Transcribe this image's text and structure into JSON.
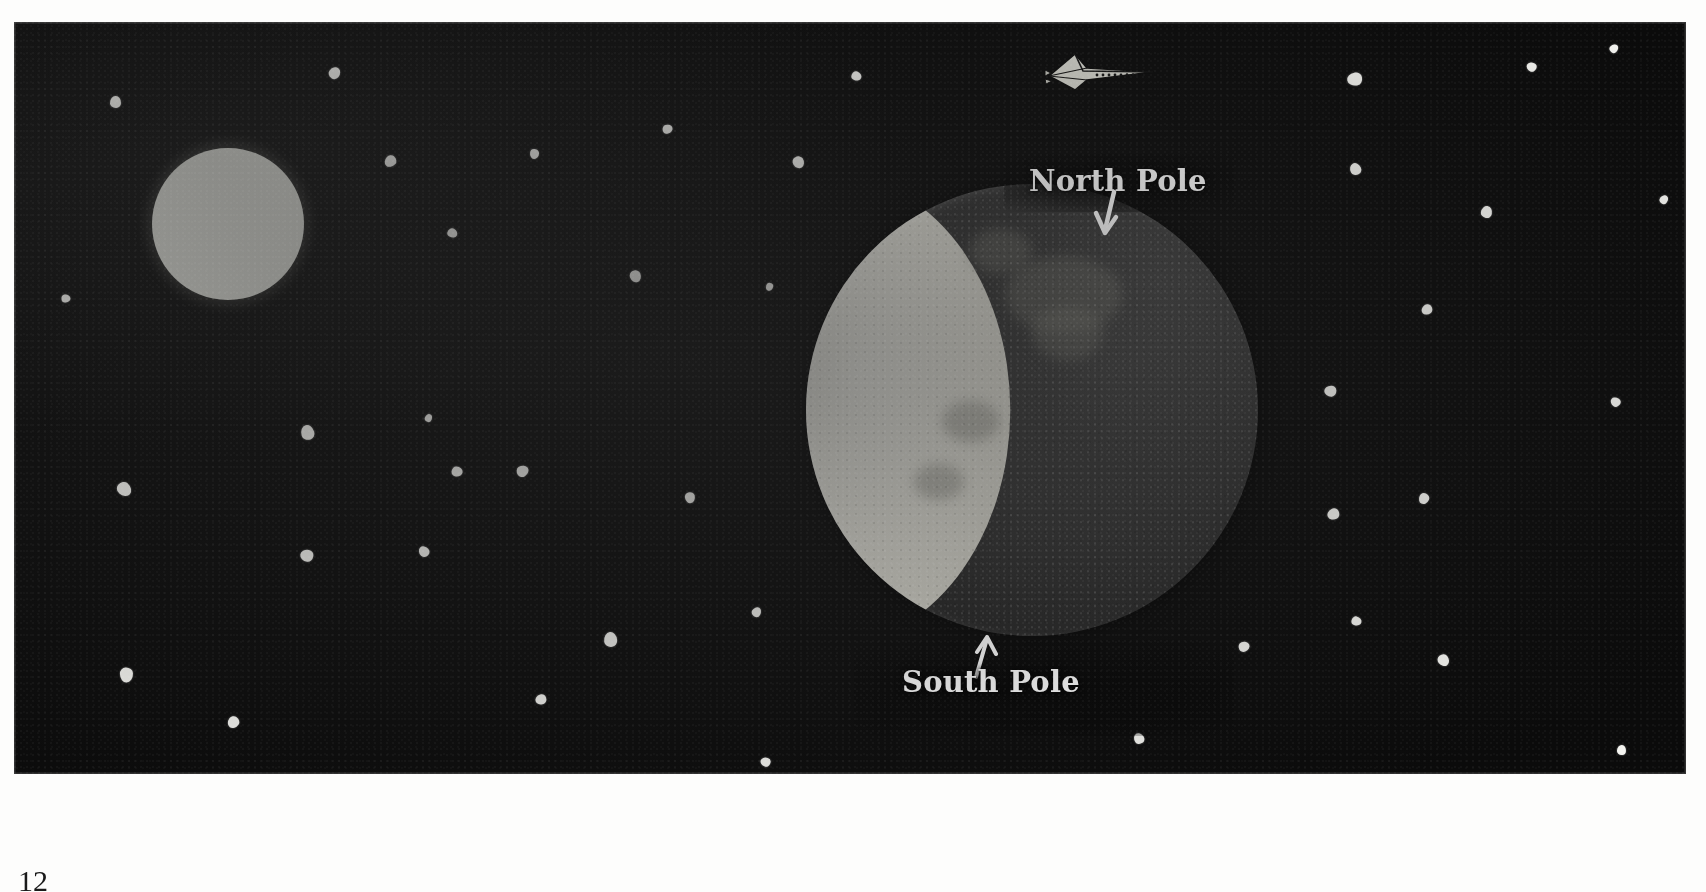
{
  "figure": {
    "kind": "astronomy-illustration",
    "background_color": "#0b0b0b",
    "panel": {
      "x": 14,
      "y": 22,
      "width": 1672,
      "height": 752
    }
  },
  "labels": {
    "north_pole": "North Pole",
    "south_pole": "South Pole",
    "north_arrow_icon": "arrow-down-icon",
    "south_arrow_icon": "arrow-up-icon",
    "text_color": "#ffffff"
  },
  "page": {
    "number": "12"
  },
  "sun": {
    "name": "sun",
    "color": "#dedfd8",
    "x": 152,
    "y": 148,
    "diameter": 152
  },
  "moon": {
    "name": "moon",
    "lit_color": "#dddcd3",
    "dark_color": "#343434",
    "mare_color": "#78786f",
    "center_x": 1032,
    "center_y": 410,
    "diameter": 452,
    "illuminated_fraction": 0.45,
    "lit_side": "left",
    "mare": [
      {
        "x": 44,
        "y": 16,
        "w": 26,
        "h": 17
      },
      {
        "x": 50,
        "y": 27,
        "w": 16,
        "h": 12
      },
      {
        "x": 36,
        "y": 10,
        "w": 14,
        "h": 10
      },
      {
        "x": 30,
        "y": 48,
        "w": 13,
        "h": 9
      },
      {
        "x": 24,
        "y": 62,
        "w": 11,
        "h": 8
      }
    ]
  },
  "spacecraft": {
    "name": "spacecraft",
    "icon": "space-shuttle-icon",
    "color": "#d8d8d0",
    "x": 1035,
    "y": 46,
    "width": 120,
    "height": 48,
    "heading": "right"
  },
  "stars": [
    {
      "x": 110,
      "y": 96,
      "s": 11
    },
    {
      "x": 329,
      "y": 67,
      "s": 11
    },
    {
      "x": 663,
      "y": 124,
      "s": 9
    },
    {
      "x": 852,
      "y": 71,
      "s": 9
    },
    {
      "x": 793,
      "y": 156,
      "s": 11
    },
    {
      "x": 530,
      "y": 149,
      "s": 9
    },
    {
      "x": 385,
      "y": 155,
      "s": 11
    },
    {
      "x": 1348,
      "y": 72,
      "s": 13
    },
    {
      "x": 1527,
      "y": 62,
      "s": 9
    },
    {
      "x": 1350,
      "y": 163,
      "s": 11
    },
    {
      "x": 1481,
      "y": 206,
      "s": 11
    },
    {
      "x": 1610,
      "y": 44,
      "s": 8
    },
    {
      "x": 62,
      "y": 294,
      "s": 8
    },
    {
      "x": 448,
      "y": 228,
      "s": 9
    },
    {
      "x": 630,
      "y": 270,
      "s": 11
    },
    {
      "x": 766,
      "y": 283,
      "s": 7
    },
    {
      "x": 1422,
      "y": 304,
      "s": 10
    },
    {
      "x": 1325,
      "y": 385,
      "s": 11
    },
    {
      "x": 1611,
      "y": 397,
      "s": 9
    },
    {
      "x": 301,
      "y": 425,
      "s": 13
    },
    {
      "x": 425,
      "y": 414,
      "s": 7
    },
    {
      "x": 517,
      "y": 465,
      "s": 11
    },
    {
      "x": 452,
      "y": 466,
      "s": 10
    },
    {
      "x": 118,
      "y": 482,
      "s": 13
    },
    {
      "x": 685,
      "y": 492,
      "s": 10
    },
    {
      "x": 1419,
      "y": 493,
      "s": 10
    },
    {
      "x": 1328,
      "y": 508,
      "s": 11
    },
    {
      "x": 301,
      "y": 549,
      "s": 12
    },
    {
      "x": 419,
      "y": 546,
      "s": 10
    },
    {
      "x": 604,
      "y": 632,
      "s": 13
    },
    {
      "x": 752,
      "y": 607,
      "s": 9
    },
    {
      "x": 1239,
      "y": 641,
      "s": 10
    },
    {
      "x": 1352,
      "y": 616,
      "s": 9
    },
    {
      "x": 1438,
      "y": 654,
      "s": 11
    },
    {
      "x": 120,
      "y": 668,
      "s": 13
    },
    {
      "x": 228,
      "y": 716,
      "s": 11
    },
    {
      "x": 536,
      "y": 694,
      "s": 10
    },
    {
      "x": 761,
      "y": 757,
      "s": 9
    },
    {
      "x": 1134,
      "y": 733,
      "s": 10
    },
    {
      "x": 1617,
      "y": 745,
      "s": 9
    },
    {
      "x": 1660,
      "y": 195,
      "s": 8
    }
  ]
}
